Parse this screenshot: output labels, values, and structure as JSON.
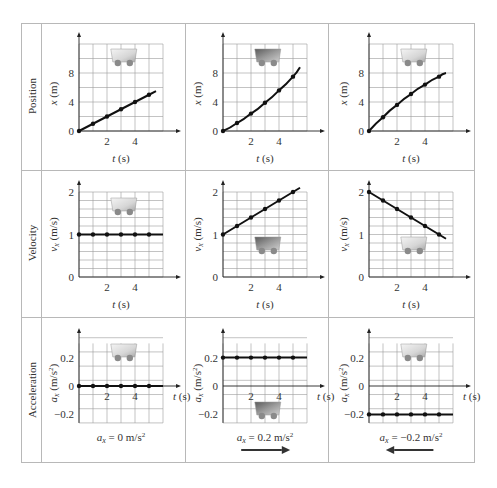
{
  "rows": [
    {
      "label": "Position"
    },
    {
      "label": "Velocity"
    },
    {
      "label": "Acceleration"
    }
  ],
  "colors": {
    "grid": "#9a9a9a",
    "axis": "#222222",
    "curve": "#111111",
    "table_border": "#b8b8b8",
    "cart_light": "#e8e8e8",
    "cart_dark": "#6f6f6f"
  },
  "chart_data": [
    {
      "type": "line",
      "row": "Position",
      "column": 1,
      "title": "",
      "xlabel": "t (s)",
      "ylabel": "x (m)",
      "x_ticks": [
        "2",
        "4"
      ],
      "y_ticks": [
        "0",
        "4",
        "8"
      ],
      "xlim": [
        0,
        6
      ],
      "ylim": [
        0,
        12
      ],
      "grid": true,
      "x": [
        0,
        1,
        2,
        3,
        4,
        5
      ],
      "y": [
        0,
        1,
        2,
        3,
        4,
        5
      ],
      "line_end": [
        5.5,
        5.5
      ],
      "annotation": "cart (light)"
    },
    {
      "type": "line",
      "row": "Position",
      "column": 2,
      "title": "",
      "xlabel": "t (s)",
      "ylabel": "x (m)",
      "x_ticks": [
        "2",
        "4"
      ],
      "y_ticks": [
        "0",
        "4",
        "8"
      ],
      "xlim": [
        0,
        6
      ],
      "ylim": [
        0,
        12
      ],
      "grid": true,
      "x": [
        0,
        1,
        2,
        3,
        4,
        5
      ],
      "y": [
        0,
        1.1,
        2.4,
        3.9,
        5.6,
        7.5
      ],
      "line_end": [
        5.5,
        8.8
      ],
      "annotation": "cart (dark, speeding up)"
    },
    {
      "type": "line",
      "row": "Position",
      "column": 3,
      "title": "",
      "xlabel": "t (s)",
      "ylabel": "x (m)",
      "x_ticks": [
        "2",
        "4"
      ],
      "y_ticks": [
        "0",
        "4",
        "8"
      ],
      "xlim": [
        0,
        6
      ],
      "ylim": [
        0,
        12
      ],
      "grid": true,
      "x": [
        0,
        1,
        2,
        3,
        4,
        5
      ],
      "y": [
        0,
        1.9,
        3.6,
        5.1,
        6.4,
        7.5
      ],
      "line_end": [
        5.5,
        8.0
      ],
      "annotation": "cart (light, slowing down)"
    },
    {
      "type": "line",
      "row": "Velocity",
      "column": 1,
      "title": "",
      "xlabel": "t (s)",
      "ylabel": "vx (m/s)",
      "x_ticks": [
        "2",
        "4"
      ],
      "y_ticks": [
        "0",
        "1",
        "2"
      ],
      "xlim": [
        0,
        6
      ],
      "ylim": [
        0,
        2
      ],
      "grid": true,
      "x": [
        0,
        1,
        2,
        3,
        4,
        5
      ],
      "y": [
        1,
        1,
        1,
        1,
        1,
        1
      ],
      "line_end": [
        6,
        1
      ]
    },
    {
      "type": "line",
      "row": "Velocity",
      "column": 2,
      "title": "",
      "xlabel": "t (s)",
      "ylabel": "vx (m/s)",
      "x_ticks": [
        "2",
        "4"
      ],
      "y_ticks": [
        "0",
        "1",
        "2"
      ],
      "xlim": [
        0,
        6
      ],
      "ylim": [
        0,
        2
      ],
      "grid": true,
      "x": [
        0,
        1,
        2,
        3,
        4,
        5
      ],
      "y": [
        1.0,
        1.2,
        1.4,
        1.6,
        1.8,
        2.0
      ],
      "line_end": [
        5.5,
        2.1
      ]
    },
    {
      "type": "line",
      "row": "Velocity",
      "column": 3,
      "title": "",
      "xlabel": "t (s)",
      "ylabel": "vx (m/s)",
      "x_ticks": [
        "2",
        "4"
      ],
      "y_ticks": [
        "0",
        "1",
        "2"
      ],
      "xlim": [
        0,
        6
      ],
      "ylim": [
        0,
        2
      ],
      "grid": true,
      "x": [
        0,
        1,
        2,
        3,
        4,
        5
      ],
      "y": [
        2.0,
        1.8,
        1.6,
        1.4,
        1.2,
        1.0
      ],
      "line_end": [
        5.5,
        0.9
      ]
    },
    {
      "type": "line",
      "row": "Acceleration",
      "column": 1,
      "title": "",
      "xlabel": "t (s)",
      "ylabel": "ax (m/s²)",
      "x_ticks": [
        "2",
        "4"
      ],
      "y_ticks": [
        "-0.2",
        "0",
        "0.2"
      ],
      "xlim": [
        0,
        6
      ],
      "ylim": [
        -0.3,
        0.3
      ],
      "grid": true,
      "x": [
        0,
        1,
        2,
        3,
        4,
        5
      ],
      "y": [
        0,
        0,
        0,
        0,
        0,
        0
      ],
      "line_end": [
        6,
        0
      ],
      "caption": "ax = 0 m/s²",
      "arrow": "none"
    },
    {
      "type": "line",
      "row": "Acceleration",
      "column": 2,
      "title": "",
      "xlabel": "t (s)",
      "ylabel": "ax (m/s²)",
      "x_ticks": [
        "2",
        "4"
      ],
      "y_ticks": [
        "-0.2",
        "0",
        "0.2"
      ],
      "xlim": [
        0,
        6
      ],
      "ylim": [
        -0.3,
        0.3
      ],
      "grid": true,
      "x": [
        0,
        1,
        2,
        3,
        4,
        5
      ],
      "y": [
        0.2,
        0.2,
        0.2,
        0.2,
        0.2,
        0.2
      ],
      "line_end": [
        6,
        0.2
      ],
      "caption": "ax = 0.2 m/s²",
      "arrow": "right"
    },
    {
      "type": "line",
      "row": "Acceleration",
      "column": 3,
      "title": "",
      "xlabel": "t (s)",
      "ylabel": "ax (m/s²)",
      "x_ticks": [
        "2",
        "4"
      ],
      "y_ticks": [
        "-0.2",
        "0",
        "0.2"
      ],
      "xlim": [
        0,
        6
      ],
      "ylim": [
        -0.3,
        0.3
      ],
      "grid": true,
      "x": [
        0,
        1,
        2,
        3,
        4,
        5
      ],
      "y": [
        -0.2,
        -0.2,
        -0.2,
        -0.2,
        -0.2,
        -0.2
      ],
      "line_end": [
        6,
        -0.2
      ],
      "caption": "ax = −0.2 m/s²",
      "arrow": "left"
    }
  ]
}
